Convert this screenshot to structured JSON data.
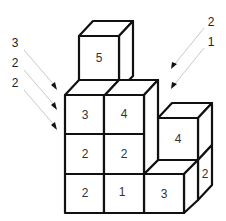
{
  "diagram": {
    "stroke_color": "#111111",
    "cubes": {
      "top": {
        "label": "5"
      },
      "row3_col1": {
        "label": "3"
      },
      "row3_col2": {
        "label": "4"
      },
      "row2_col1": {
        "label": "2"
      },
      "row2_col2": {
        "label": "2"
      },
      "row1_col1": {
        "label": "2"
      },
      "row1_col2": {
        "label": "1"
      },
      "front_right": {
        "label": "3"
      },
      "back_right": {
        "label": "4"
      },
      "side_right": {
        "label": "2"
      }
    },
    "left_arrows": [
      {
        "label": "3"
      },
      {
        "label": "2"
      },
      {
        "label": "2"
      }
    ],
    "right_arrows": [
      {
        "label": "2"
      },
      {
        "label": "1"
      }
    ]
  }
}
